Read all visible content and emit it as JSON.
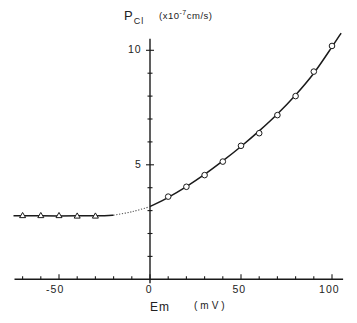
{
  "chart_data": {
    "type": "line",
    "title": "",
    "xlabel": "Em",
    "xlabel_unit": "(mV)",
    "ylabel": "P",
    "ylabel_subscript": "Cl",
    "ylabel_unit_prefix": "(x10",
    "ylabel_unit_exponent": "-7",
    "ylabel_unit_suffix": "cm/s)",
    "xlim": [
      -75,
      105
    ],
    "ylim": [
      0,
      10.5
    ],
    "x_ticks": [
      -70,
      -60,
      -50,
      -40,
      -30,
      -20,
      -10,
      0,
      10,
      20,
      30,
      40,
      50,
      60,
      70,
      80,
      90,
      100
    ],
    "x_tick_labels": [
      {
        "value": -50,
        "label": "-50"
      },
      {
        "value": 0,
        "label": "0"
      },
      {
        "value": 50,
        "label": "50"
      },
      {
        "value": 100,
        "label": "100"
      }
    ],
    "y_ticks": [
      1,
      2,
      3,
      4,
      5,
      6,
      7,
      8,
      9,
      10
    ],
    "y_tick_labels": [
      {
        "value": 5,
        "label": "5"
      },
      {
        "value": 10,
        "label": "10"
      }
    ],
    "grid": false,
    "legend": null,
    "series": [
      {
        "name": "triangles",
        "marker": "triangle-open",
        "x": [
          -70,
          -60,
          -50,
          -40,
          -30
        ],
        "y": [
          2.78,
          2.78,
          2.78,
          2.76,
          2.76
        ]
      },
      {
        "name": "circles",
        "marker": "circle-open",
        "x": [
          10,
          20,
          30,
          40,
          50,
          60,
          70,
          80,
          90,
          100
        ],
        "y": [
          3.61,
          4.04,
          4.55,
          5.14,
          5.83,
          6.38,
          7.17,
          8.0,
          9.07,
          10.19
        ]
      },
      {
        "name": "fit-curve",
        "marker": "none",
        "style": "solid (dotted between -20 and 0 mV)",
        "x": [
          -75,
          -60,
          -40,
          -25,
          -20,
          -10,
          0,
          10,
          20,
          30,
          40,
          50,
          60,
          70,
          80,
          90,
          100,
          105
        ],
        "y": [
          2.77,
          2.77,
          2.77,
          2.78,
          2.8,
          2.95,
          3.17,
          3.58,
          4.05,
          4.58,
          5.17,
          5.8,
          6.48,
          7.22,
          8.05,
          9.0,
          10.15,
          10.75
        ]
      }
    ]
  },
  "labels": {
    "y_main": "P",
    "y_sub": "Cl",
    "y_unit_a": "(x10",
    "y_unit_exp": "-7",
    "y_unit_b": "cm/s)",
    "x_main": "Em",
    "x_unit": "(mV)"
  }
}
